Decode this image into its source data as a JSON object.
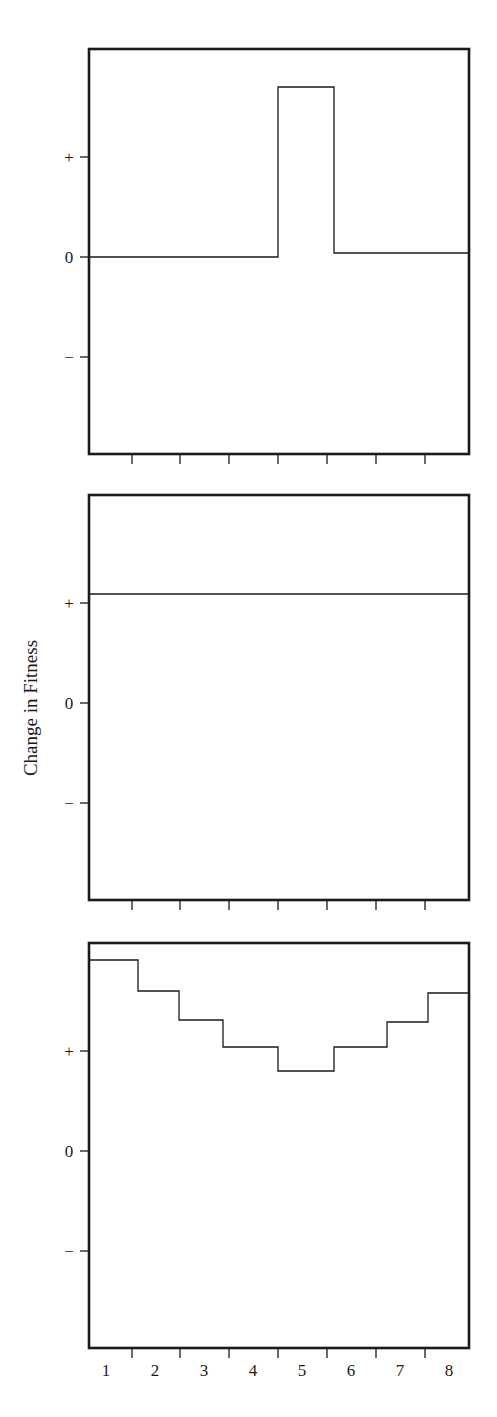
{
  "chart_data": {
    "type": "line",
    "ylabel": "Change in Fitness",
    "xlabel": "",
    "x_categories": [
      "1",
      "2",
      "3",
      "4",
      "5",
      "6",
      "7",
      "8"
    ],
    "y_tick_labels": [
      "+",
      "0",
      "−"
    ],
    "layout": {
      "panels": 3,
      "stacked": "vertical",
      "shared_x": true,
      "grid": false,
      "legend": "none",
      "step_style": true
    },
    "panels": [
      {
        "name": "top",
        "description": "Step function: zero everywhere except a sharp positive peak at position 5",
        "x": [
          1,
          2,
          3,
          4,
          5,
          6,
          7,
          8
        ],
        "values": [
          0,
          0,
          0,
          0,
          1.7,
          0.04,
          0.04,
          0.04
        ],
        "ylim": [
          -2,
          2
        ]
      },
      {
        "name": "middle",
        "description": "Constant positive line across all positions",
        "x": [
          1,
          2,
          3,
          4,
          5,
          6,
          7,
          8
        ],
        "values": [
          1.09,
          1.09,
          1.09,
          1.09,
          1.09,
          1.09,
          1.09,
          1.09
        ],
        "ylim": [
          -2,
          2
        ]
      },
      {
        "name": "bottom",
        "description": "U-shaped step function, all positive, minimum at position 5",
        "x": [
          1,
          2,
          3,
          4,
          5,
          6,
          7,
          8
        ],
        "values": [
          1.91,
          1.6,
          1.31,
          1.04,
          0.8,
          1.04,
          1.29,
          1.58
        ],
        "ylim": [
          -2,
          2
        ]
      }
    ]
  }
}
